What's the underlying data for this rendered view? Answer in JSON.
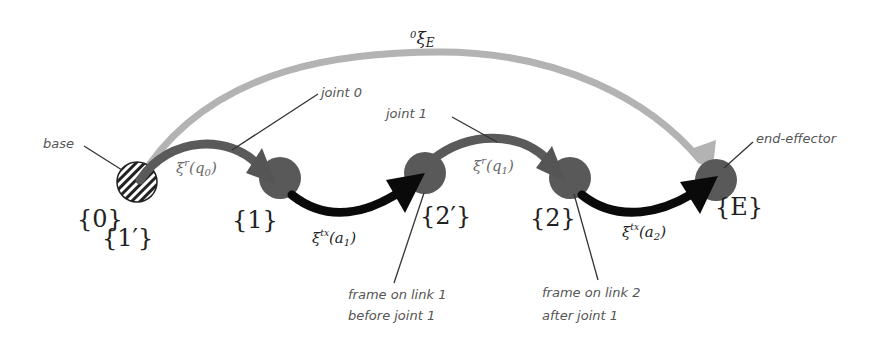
{
  "diagram": {
    "type": "kinematic-chain",
    "colors": {
      "total_transform": "#b3b3b3",
      "rotation_link": "#5a5a5a",
      "translation_link": "#0a0a0a",
      "joint_node": "#595959",
      "base_hatch": "#222222",
      "annotation_text": "#555555"
    },
    "frames": [
      {
        "id": "f0",
        "label": "{0}"
      },
      {
        "id": "f1p",
        "label": "{1′}"
      },
      {
        "id": "f1",
        "label": "{1}"
      },
      {
        "id": "f2p",
        "label": "{2′}"
      },
      {
        "id": "f2",
        "label": "{2}"
      },
      {
        "id": "fE",
        "label": "{E}"
      }
    ],
    "transforms": {
      "total": {
        "base": "ξ",
        "pre_sup": "0",
        "sub": "E"
      },
      "r_q0": {
        "base": "ξ",
        "sup": "r",
        "arg": "(q",
        "arg_sub": "0",
        "close": ")"
      },
      "tx_a1": {
        "base": "ξ",
        "sup": "tx",
        "arg": "(a",
        "arg_sub": "1",
        "close": ")"
      },
      "r_q1": {
        "base": "ξ",
        "sup": "r",
        "arg": "(q",
        "arg_sub": "1",
        "close": ")"
      },
      "tx_a2": {
        "base": "ξ",
        "sup": "tx",
        "arg": "(a",
        "arg_sub": "2",
        "close": ")"
      }
    },
    "annotations": {
      "base": "base",
      "joint0": "joint 0",
      "joint1": "joint 1",
      "end_effector": "end-effector",
      "frame_link1_line1": "frame on link 1",
      "frame_link1_line2": "before joint 1",
      "frame_link2_line1": "frame on link 2",
      "frame_link2_line2": "after joint 1"
    }
  }
}
